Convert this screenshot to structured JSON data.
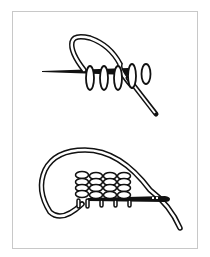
{
  "figure": {
    "panels": [
      {
        "id": "top",
        "content": "Needle with five loops wrapped around it and a thread loop passing over"
      },
      {
        "id": "bottom",
        "content": "Needle with stacked rows of stitches and a long thread loop curving around"
      }
    ]
  },
  "colors": {
    "ink": "#111111",
    "frame": "#c8c8c8",
    "background": "#ffffff"
  }
}
